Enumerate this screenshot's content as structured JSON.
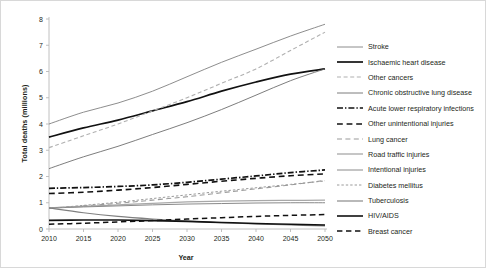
{
  "chart_data": {
    "type": "line",
    "title": "",
    "xlabel": "Year",
    "ylabel": "Total deaths (millions)",
    "xlim": [
      2010,
      2050
    ],
    "ylim": [
      0,
      8
    ],
    "xticks": [
      "2010",
      "2015",
      "2020",
      "2025",
      "2030",
      "2035",
      "2040",
      "2045",
      "2050"
    ],
    "yticks": [
      "0",
      "1",
      "2",
      "3",
      "4",
      "5",
      "6",
      "7",
      "8"
    ],
    "grid": false,
    "legend_position": "right",
    "x": [
      2010,
      2015,
      2020,
      2025,
      2030,
      2035,
      2040,
      2045,
      2050
    ],
    "series": [
      {
        "name": "Stroke",
        "style": "solid",
        "color": "#808080",
        "width": 0.9,
        "values": [
          4.0,
          4.45,
          4.8,
          5.25,
          5.8,
          6.35,
          6.85,
          7.35,
          7.8
        ]
      },
      {
        "name": "Ischaemic heart disease",
        "style": "solid",
        "color": "#111111",
        "width": 1.7,
        "values": [
          3.5,
          3.85,
          4.15,
          4.5,
          4.85,
          5.25,
          5.6,
          5.9,
          6.1
        ]
      },
      {
        "name": "Other cancers",
        "style": "dashed",
        "color": "#b0b0b0",
        "width": 1.1,
        "values": [
          3.1,
          3.55,
          4.0,
          4.5,
          5.0,
          5.55,
          6.1,
          6.8,
          7.5
        ]
      },
      {
        "name": "Chronic obstructive lung disease",
        "style": "solid",
        "color": "#6e6e6e",
        "width": 0.9,
        "values": [
          2.3,
          2.75,
          3.15,
          3.6,
          4.05,
          4.55,
          5.1,
          5.65,
          6.1
        ]
      },
      {
        "name": "Acute lower respiratory infections",
        "style": "dashdot",
        "color": "#111111",
        "width": 1.7,
        "values": [
          1.55,
          1.58,
          1.62,
          1.68,
          1.78,
          1.9,
          2.02,
          2.15,
          2.25
        ]
      },
      {
        "name": "Other unintentional injuries",
        "style": "dashed",
        "color": "#111111",
        "width": 1.6,
        "values": [
          1.35,
          1.4,
          1.48,
          1.58,
          1.7,
          1.82,
          1.93,
          2.03,
          2.1
        ]
      },
      {
        "name": "Lung cancer",
        "style": "longdash",
        "color": "#9a9a9a",
        "width": 1.1,
        "values": [
          0.8,
          0.88,
          0.98,
          1.1,
          1.23,
          1.38,
          1.53,
          1.68,
          1.85
        ]
      },
      {
        "name": "Road traffic injuries",
        "style": "solid",
        "color": "#a8a8a8",
        "width": 1.3,
        "values": [
          0.8,
          0.86,
          0.92,
          0.98,
          1.03,
          1.06,
          1.08,
          1.09,
          1.1
        ]
      },
      {
        "name": "Intentional injuries",
        "style": "solid",
        "color": "#8a8a8a",
        "width": 1.0,
        "values": [
          0.8,
          0.84,
          0.88,
          0.92,
          0.95,
          0.97,
          0.99,
          1.0,
          1.0
        ]
      },
      {
        "name": "Diabetes mellitus",
        "style": "shortdash",
        "color": "#9a9a9a",
        "width": 1.0,
        "values": [
          0.78,
          0.9,
          1.02,
          1.16,
          1.3,
          1.44,
          1.57,
          1.7,
          1.83
        ]
      },
      {
        "name": "Tuberculosis",
        "style": "solid",
        "color": "#808080",
        "width": 1.1,
        "values": [
          0.8,
          0.62,
          0.48,
          0.38,
          0.3,
          0.24,
          0.19,
          0.15,
          0.12
        ]
      },
      {
        "name": "HIV/AIDS",
        "style": "solid",
        "color": "#111111",
        "width": 1.6,
        "values": [
          0.33,
          0.34,
          0.34,
          0.32,
          0.29,
          0.25,
          0.21,
          0.18,
          0.15
        ]
      },
      {
        "name": "Breast cancer",
        "style": "dashed",
        "color": "#111111",
        "width": 1.5,
        "values": [
          0.18,
          0.22,
          0.27,
          0.32,
          0.38,
          0.43,
          0.48,
          0.52,
          0.55
        ]
      }
    ]
  }
}
